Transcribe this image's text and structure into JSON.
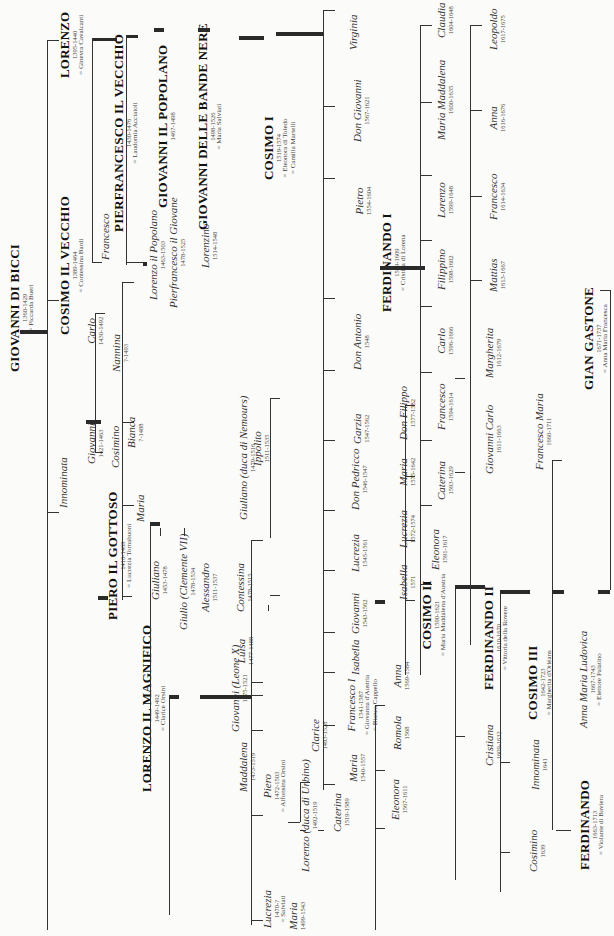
{
  "colors": {
    "ink": "#222222",
    "paper": "#fbfbf9",
    "line": "#333333"
  },
  "nodes": {
    "giovanni_di_bicci": {
      "name": "GIOVANNI DI BICCI",
      "dates": "1360-1429",
      "spouse": "= Piccarda Bueri"
    },
    "lorenzo": {
      "name": "LORENZO",
      "dates": "1395-1440",
      "spouse": "= Ginevra Cavalcanti"
    },
    "cosimo_vecchio": {
      "name": "COSIMO IL VECCHIO",
      "dates": "1389-1464",
      "spouse": "= Contessina Bardi"
    },
    "innominata_1": {
      "name": "Innominata"
    },
    "francesco_1": {
      "name": "Francesco"
    },
    "pierfrancesco_vecchio": {
      "name": "PIERFRANCESCO IL VECCHIO",
      "dates": "1430-1476",
      "spouse": "= Laudomia Acciaioli"
    },
    "lorenzo_popolano": {
      "name": "Lorenzo il Popolano",
      "dates": "1463-1503"
    },
    "pierfrancesco_giovane": {
      "name": "Pierfrancesco il Giovane",
      "dates": "1478-1525"
    },
    "lorenzino": {
      "name": "Lorenzino",
      "dates": "1514-1548"
    },
    "giovanni_popolano": {
      "name": "GIOVANNI IL POPOLANO",
      "dates": "1467-1498"
    },
    "giovanni_bande_nere": {
      "name": "GIOVANNI DELLE BANDE NERE",
      "dates": "1498-1526",
      "spouse": "= Maria Salviati"
    },
    "cosimo_i": {
      "name": "COSIMO I",
      "dates": "1519-1574",
      "spouse": "= Eleonora di Toledo",
      "spouse2": "= Camilla Martelli"
    },
    "carlo_1": {
      "name": "Carlo",
      "dates": "1430-1492"
    },
    "giovanni_2": {
      "name": "Giovanni",
      "dates": "1421-1463"
    },
    "cosimino_1": {
      "name": "Cosimino"
    },
    "piero_gottoso": {
      "name": "PIERO IL GOTTOSO",
      "dates": "1416-1469",
      "spouse": "= Lucrezia Tornabuoni"
    },
    "nannina": {
      "name": "Nannina",
      "dates": "?-1493"
    },
    "bianca": {
      "name": "Bianca",
      "dates": "?-1488"
    },
    "maria_1": {
      "name": "Maria"
    },
    "giuliano_1": {
      "name": "Giuliano",
      "dates": "1453-1478"
    },
    "giulio": {
      "name": "Giulio (Clemente VII)",
      "dates": "1478-1534"
    },
    "alessandro": {
      "name": "Alessandro",
      "dates": "1511-1537"
    },
    "lorenzo_magnifico": {
      "name": "LORENZO IL MAGNIFICO",
      "dates": "1449-1492",
      "spouse": "= Clarice Orsini"
    },
    "giuliano_nemours": {
      "name": "Giuliano (duca di Nemours)",
      "dates": "1479-1516"
    },
    "ippolito": {
      "name": "Ippolito",
      "dates": "1511-1535"
    },
    "contessina": {
      "name": "Contessina",
      "dates": "1478-1515"
    },
    "luisa": {
      "name": "Luisa",
      "dates": "1477-1488"
    },
    "giovanni_leone": {
      "name": "Giovanni (Leone X)",
      "dates": "1475-1521"
    },
    "maddalena": {
      "name": "Maddalena",
      "dates": "1473-1519"
    },
    "piero_2": {
      "name": "Piero",
      "dates": "1472-1503",
      "spouse": "= Alfonsina Orsini"
    },
    "lucrezia_1": {
      "name": "Lucrezia",
      "dates": "1470-?",
      "spouse": "= Salviati"
    },
    "maria_salviati": {
      "name": "Maria",
      "dates": "1499-1543"
    },
    "lorenzo_urbino": {
      "name": "Lorenzo (duca di Urbino)",
      "dates": "1492-1519"
    },
    "caterina_1": {
      "name": "Caterina",
      "dates": "1519-1589"
    },
    "clarice": {
      "name": "Clarice",
      "dates": "1493-1528"
    },
    "virginia": {
      "name": "Virginia"
    },
    "don_giovanni": {
      "name": "Don Giovanni",
      "dates": "1567-1621"
    },
    "pietro": {
      "name": "Pietro",
      "dates": "1554-1604"
    },
    "ferdinando_i": {
      "name": "FERDINANDO I",
      "dates": "1549-1609",
      "spouse": "= Cristina di Lorena"
    },
    "don_antonio": {
      "name": "Don Antonio",
      "dates": "1548"
    },
    "garzia": {
      "name": "Garzia",
      "dates": "1547-1562"
    },
    "don_pedricco": {
      "name": "Don Pedricco",
      "dates": "1546-1547"
    },
    "lucrezia_2": {
      "name": "Lucrezia",
      "dates": "1545-1561"
    },
    "giovanni_3": {
      "name": "Giovanni",
      "dates": "1543-1562"
    },
    "isabella_1": {
      "name": "Isabella"
    },
    "francesco_i": {
      "name": "Francesco I",
      "dates": "1541-1587",
      "spouse": "= Giovanna d'Austria",
      "spouse2": "= Bianca Cappello"
    },
    "maria_2": {
      "name": "Maria",
      "dates": "1540-1557"
    },
    "claudia": {
      "name": "Claudia",
      "dates": "1604-1648"
    },
    "maria_maddalena": {
      "name": "Maria Maddalena",
      "dates": "1600-1635"
    },
    "lorenzo_3": {
      "name": "Lorenzo",
      "dates": "1599-1648"
    },
    "filippino": {
      "name": "Filippino",
      "dates": "1598-1602"
    },
    "carlo_2": {
      "name": "Carlo",
      "dates": "1596-1666"
    },
    "francesco_3": {
      "name": "Francesco",
      "dates": "1594-1614"
    },
    "caterina_2": {
      "name": "Caterina",
      "dates": "1593-1629"
    },
    "eleonora_2": {
      "name": "Eleonora",
      "dates": "1591-1617"
    },
    "cosimo_ii": {
      "name": "COSIMO II",
      "dates": "1590-1621",
      "spouse": "= Maria Maddalena d'Austria"
    },
    "don_filippo": {
      "name": "Don Filippo",
      "dates": "1577-1582"
    },
    "maria_3": {
      "name": "Maria",
      "dates": "1575-1642"
    },
    "lucrezia_3": {
      "name": "Lucrezia",
      "dates": "1572-1574"
    },
    "isabella_2": {
      "name": "Isabella",
      "dates": "1571"
    },
    "anna_1": {
      "name": "Anna",
      "dates": "1569-1584"
    },
    "romola": {
      "name": "Romola",
      "dates": "1568"
    },
    "eleonora_1": {
      "name": "Eleonora",
      "dates": "1567-1611"
    },
    "leopoldo": {
      "name": "Leopoldo",
      "dates": "1617-1675"
    },
    "anna_2": {
      "name": "Anna",
      "dates": "1616-1676"
    },
    "francesco_4": {
      "name": "Francesco",
      "dates": "1614-1634"
    },
    "mattias": {
      "name": "Mattias",
      "dates": "1613-1667"
    },
    "margherita": {
      "name": "Margherita",
      "dates": "1612-1679"
    },
    "giovanni_carlo": {
      "name": "Giovanni Carlo",
      "dates": "1611-1663"
    },
    "ferdinando_ii": {
      "name": "FERDINANDO II",
      "dates": "1610-1670",
      "spouse": "= Vittoria della Rovere"
    },
    "cristiana": {
      "name": "Cristiana",
      "dates": "1609-1632"
    },
    "francesco_maria": {
      "name": "Francesco Maria",
      "dates": "1660-1711"
    },
    "cosimo_iii": {
      "name": "COSIMO III",
      "dates": "1642-1723",
      "spouse": "= Margherita d'Orléans"
    },
    "innominata_2": {
      "name": "Innominata",
      "dates": "1641"
    },
    "cosimino_2": {
      "name": "Cosimino",
      "dates": "1639"
    },
    "gian_gastone": {
      "name": "GIAN GASTONE",
      "dates": "1671-1737",
      "spouse": "= Anna Maria Francesca"
    },
    "anna_maria_ludovica": {
      "name": "Anna Maria Ludovica",
      "dates": "1667-1743",
      "spouse": "= Elettore Palatino"
    },
    "ferdinando_3": {
      "name": "FERDINANDO",
      "dates": "1663-1713",
      "spouse": "= Violante di Baviera"
    }
  }
}
